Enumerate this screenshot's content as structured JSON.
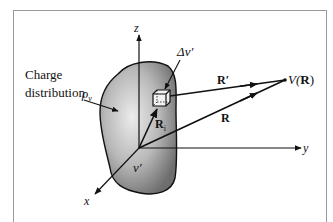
{
  "diagram": {
    "labels": {
      "charge_line1": "Charge",
      "charge_line2": "distribution",
      "rho": "ρ",
      "rho_sub": "v",
      "volume_element": "Δv′",
      "volume": "v′",
      "r_prime": "R′",
      "r": "R",
      "r_i": "R",
      "r_i_sub": "i",
      "point_v": "V(",
      "point_r": "R",
      "point_close": ")",
      "axis_x": "x",
      "axis_y": "y",
      "axis_z": "z"
    },
    "nodes": [
      {
        "id": "origin",
        "x": 139,
        "y": 148
      },
      {
        "id": "volume-element",
        "x": 161,
        "y": 98
      },
      {
        "id": "field-point",
        "x": 285,
        "y": 80
      }
    ],
    "edges": [
      {
        "from": "origin",
        "to": "z-axis-end",
        "kind": "axis"
      },
      {
        "from": "origin",
        "to": "y-axis-end",
        "kind": "axis"
      },
      {
        "from": "origin",
        "to": "x-axis-end",
        "kind": "axis"
      },
      {
        "from": "origin",
        "to": "volume-element",
        "label": "R_i"
      },
      {
        "from": "volume-element",
        "to": "field-point",
        "label": "R′"
      },
      {
        "from": "origin",
        "to": "field-point",
        "label": "R"
      }
    ],
    "colors": {
      "frame": "#9a9a9a",
      "line": "#111111",
      "blob_light": "#e6e6e6",
      "blob_dark": "#6e6e6e"
    }
  }
}
